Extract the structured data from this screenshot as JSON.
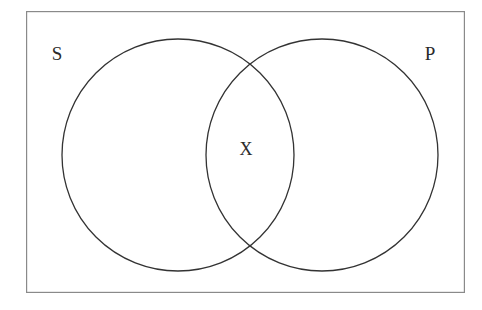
{
  "diagram": {
    "kind": "venn-diagram",
    "background_color": "#ffffff",
    "frame": {
      "name": "universe-rectangle",
      "stroke_color": "#8a8a8a",
      "stroke_width": 1.2,
      "x": 26,
      "y": 11,
      "width": 439,
      "height": 282
    },
    "circles": [
      {
        "name": "subject-circle",
        "label": "S",
        "cx": 178,
        "cy": 155,
        "r": 116,
        "stroke_color": "#333333",
        "stroke_width": 1.3,
        "fill": "none"
      },
      {
        "name": "predicate-circle",
        "label": "P",
        "cx": 322,
        "cy": 155,
        "r": 116,
        "stroke_color": "#333333",
        "stroke_width": 1.3,
        "fill": "none"
      }
    ],
    "labels": [
      {
        "name": "subject-label",
        "text": "S",
        "x": 57,
        "y": 53,
        "font_size": 19,
        "color": "#2b2b2b"
      },
      {
        "name": "predicate-label",
        "text": "P",
        "x": 430,
        "y": 53,
        "font_size": 19,
        "color": "#2b2b2b"
      },
      {
        "name": "intersection-marker",
        "text": "X",
        "x": 246,
        "y": 149,
        "font_size": 18,
        "color": "#2b2b2b",
        "region": "S-and-P overlap"
      }
    ]
  }
}
